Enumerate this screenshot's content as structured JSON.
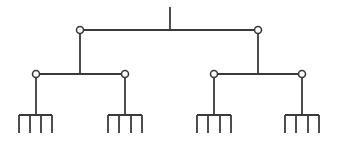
{
  "diagram": {
    "type": "tree",
    "colors": {
      "stroke": "#3a3a3a",
      "node_fill": "#ffffff",
      "background": "#ffffff"
    },
    "root": {
      "x": 170,
      "y_top": 7,
      "y_bottom": 30
    },
    "level1": {
      "bar_y": 30,
      "nodes": [
        {
          "id": "L",
          "x": 80,
          "y": 30
        },
        {
          "id": "R",
          "x": 258,
          "y": 30
        }
      ]
    },
    "level2": {
      "bar_y": 74,
      "groups": [
        {
          "parent": "L",
          "stem_x": 80,
          "nodes": [
            {
              "id": "LL",
              "x": 36,
              "y": 74
            },
            {
              "id": "LR",
              "x": 125,
              "y": 74
            }
          ]
        },
        {
          "parent": "R",
          "stem_x": 258,
          "nodes": [
            {
              "id": "RL",
              "x": 214,
              "y": 74
            },
            {
              "id": "RR",
              "x": 302,
              "y": 74
            }
          ]
        }
      ]
    },
    "combs": {
      "top_y": 115,
      "bottom_y": 133,
      "items": [
        {
          "parent": "LL",
          "stem_x": 36,
          "teeth_x": [
            19,
            30,
            41,
            52
          ]
        },
        {
          "parent": "LR",
          "stem_x": 125,
          "teeth_x": [
            108,
            119,
            131,
            142
          ]
        },
        {
          "parent": "RL",
          "stem_x": 214,
          "teeth_x": [
            197,
            208,
            220,
            231
          ]
        },
        {
          "parent": "RR",
          "stem_x": 302,
          "teeth_x": [
            285,
            296,
            308,
            319
          ]
        }
      ]
    },
    "node_radius": 3.5
  }
}
